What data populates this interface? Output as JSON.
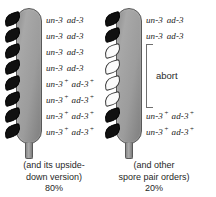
{
  "figure": {
    "type": "ascus-spore-diagram",
    "asci": [
      {
        "id": "left-ascus",
        "name": "parental-ditype-ascus",
        "spores": [
          {
            "color": "black",
            "genotype": {
              "gene1": "un-3",
              "gene1_sup": "",
              "gene2": "ad-3",
              "gene2_sup": ""
            }
          },
          {
            "color": "black",
            "genotype": {
              "gene1": "un-3",
              "gene1_sup": "",
              "gene2": "ad-3",
              "gene2_sup": ""
            }
          },
          {
            "color": "black",
            "genotype": {
              "gene1": "un-3",
              "gene1_sup": "",
              "gene2": "ad-3",
              "gene2_sup": ""
            }
          },
          {
            "color": "black",
            "genotype": {
              "gene1": "un-3",
              "gene1_sup": "",
              "gene2": "ad-3",
              "gene2_sup": ""
            }
          },
          {
            "color": "black",
            "genotype": {
              "gene1": "un-3",
              "gene1_sup": "+",
              "gene2": "ad-3",
              "gene2_sup": "+"
            }
          },
          {
            "color": "black",
            "genotype": {
              "gene1": "un-3",
              "gene1_sup": "+",
              "gene2": "ad-3",
              "gene2_sup": "+"
            }
          },
          {
            "color": "black",
            "genotype": {
              "gene1": "un-3",
              "gene1_sup": "+",
              "gene2": "ad-3",
              "gene2_sup": "+"
            }
          },
          {
            "color": "black",
            "genotype": {
              "gene1": "un-3",
              "gene1_sup": "+",
              "gene2": "ad-3",
              "gene2_sup": "+"
            }
          }
        ],
        "bracket": null,
        "caption": {
          "line1": "(and its upside-",
          "line2": "down version)",
          "percent": "80%"
        }
      },
      {
        "id": "right-ascus",
        "name": "aborted-spore-ascus",
        "spores": [
          {
            "color": "black",
            "genotype": {
              "gene1": "un-3",
              "gene1_sup": "",
              "gene2": "ad-3",
              "gene2_sup": ""
            }
          },
          {
            "color": "black",
            "genotype": {
              "gene1": "un-3",
              "gene1_sup": "",
              "gene2": "ad-3",
              "gene2_sup": ""
            }
          },
          {
            "color": "white",
            "genotype": null
          },
          {
            "color": "white",
            "genotype": null
          },
          {
            "color": "white",
            "genotype": null
          },
          {
            "color": "white",
            "genotype": null
          },
          {
            "color": "black",
            "genotype": {
              "gene1": "un-3",
              "gene1_sup": "+",
              "gene2": "ad-3",
              "gene2_sup": "+"
            }
          },
          {
            "color": "black",
            "genotype": {
              "gene1": "un-3",
              "gene1_sup": "+",
              "gene2": "ad-3",
              "gene2_sup": "+"
            }
          }
        ],
        "bracket": {
          "label": "abort",
          "spans_spores": [
            3,
            4,
            5,
            6
          ]
        },
        "caption": {
          "line1": "(and other",
          "line2": "spore pair orders)",
          "percent": "20%"
        }
      }
    ],
    "colors": {
      "ascus_fill": "#a0a0a0",
      "ascus_border": "#595959",
      "spore_black": "#101010",
      "spore_white": "#fbfbfb",
      "text": "#1b1b1b",
      "background": "#ffffff"
    }
  }
}
